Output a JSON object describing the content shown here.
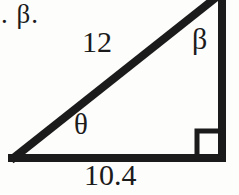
{
  "figure": {
    "type": "right-triangle-diagram",
    "background_color": "#fdfdfc",
    "stroke_color": "#1b1b1b",
    "fragment_text": ". β.",
    "labels": {
      "hypotenuse": "12",
      "base": "10.4",
      "top_angle": "β",
      "left_angle": "θ"
    },
    "geometry": {
      "left_vertex": [
        10,
        158
      ],
      "right_vertex": [
        224,
        158
      ],
      "top_vertex": [
        224,
        -8
      ],
      "stroke_width": 8,
      "right_angle_marker": {
        "x": 197,
        "y": 131,
        "size": 26
      }
    }
  }
}
